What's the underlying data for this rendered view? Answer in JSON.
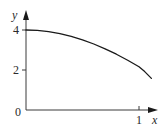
{
  "chart_data": {
    "type": "line",
    "title": "",
    "xlabel": "x",
    "ylabel": "y",
    "origin_label": "0",
    "x_ticks": [
      {
        "value": 1,
        "label": "1"
      }
    ],
    "y_ticks": [
      {
        "value": 2,
        "label": "2"
      },
      {
        "value": 4,
        "label": "4"
      }
    ],
    "xlim": [
      0,
      1.18
    ],
    "ylim": [
      0,
      4.8
    ],
    "grid": false,
    "legend": null,
    "series": [
      {
        "name": "curve",
        "x": [
          0,
          0.1,
          0.2,
          0.3,
          0.4,
          0.5,
          0.6,
          0.7,
          0.8,
          0.9,
          1.0,
          1.05,
          1.11
        ],
        "y": [
          4.0,
          3.98,
          3.92,
          3.82,
          3.68,
          3.51,
          3.3,
          3.06,
          2.79,
          2.49,
          2.16,
          1.92,
          1.58
        ]
      }
    ],
    "colors": {
      "axis": "#3a3a3a",
      "curve": "#1a1a1a",
      "text": "#2a2a2a"
    }
  }
}
